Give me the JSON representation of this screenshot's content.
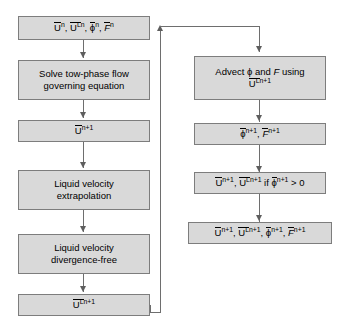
{
  "diagram": {
    "type": "flowchart",
    "colors": {
      "node_fill": "#d9d9d9",
      "node_border": "#7d7d7d",
      "connector": "#6e6e6e",
      "background": "#ffffff",
      "text": "#000000"
    },
    "left_column": {
      "initial_state": {
        "terms": [
          {
            "base": "U",
            "overline": true,
            "sup_left": "",
            "sup": "n"
          },
          {
            "base": "U",
            "overline": true,
            "sup_left": "L",
            "sup": "n"
          },
          {
            "base": "ϕ",
            "overline": true,
            "sup_left": "",
            "sup": "n"
          },
          {
            "base": "F",
            "overline": true,
            "sup_left": "",
            "sup": "n",
            "italic": true
          }
        ],
        "text": "Ūⁿ, Ūᴸⁿ, ϕ̄ⁿ, F̄ⁿ"
      },
      "solve_step": {
        "line1": "Solve tow-phase flow",
        "line2": "governing equation"
      },
      "velocity_state": {
        "terms": [
          {
            "base": "U",
            "overline": true,
            "sup_left": "",
            "sup": "n+1"
          }
        ]
      },
      "extrapolation_step": {
        "line1": "Liquid velocity",
        "line2": "extrapolation"
      },
      "divergence_step": {
        "line1": "Liquid velocity",
        "line2": "divergence-free"
      },
      "liquid_velocity_state": {
        "terms": [
          {
            "base": "U",
            "overline": true,
            "sup_left": "L",
            "sup": "n+1"
          }
        ]
      }
    },
    "right_column": {
      "advect_step": {
        "line1": "Advect ϕ and F using",
        "line1_parts": {
          "pre": "Advect ",
          "phi": "ϕ",
          "mid": " and ",
          "f": "F",
          "post": " using"
        },
        "line2_terms": [
          {
            "base": "U",
            "overline": true,
            "sup_left": "L",
            "sup": "n+1"
          }
        ]
      },
      "advected_state": {
        "terms": [
          {
            "base": "ϕ",
            "overline": true,
            "sup_left": "",
            "sup": "n+1"
          },
          {
            "base": "F",
            "overline": true,
            "sup_left": "",
            "sup": "n+1",
            "italic": true
          }
        ]
      },
      "conditional_state": {
        "terms": [
          {
            "base": "U",
            "overline": true,
            "sup_left": "",
            "sup": "n+1"
          },
          {
            "base": "U",
            "overline": true,
            "sup_left": "L",
            "sup": "n+1"
          }
        ],
        "condition_prefix": "if",
        "condition_term": {
          "base": "ϕ",
          "overline": true,
          "sup": "n+1"
        },
        "condition_operator": "> 0"
      },
      "final_state": {
        "terms": [
          {
            "base": "U",
            "overline": true,
            "sup_left": "",
            "sup": "n+1"
          },
          {
            "base": "U",
            "overline": true,
            "sup_left": "L",
            "sup": "n+1"
          },
          {
            "base": "ϕ",
            "overline": true,
            "sup_left": "",
            "sup": "n+1"
          },
          {
            "base": "F",
            "overline": true,
            "sup_left": "",
            "sup": "n+1",
            "italic": true
          }
        ]
      }
    },
    "separators": {
      "comma": ",",
      "gt_zero": "> 0",
      "if_label": "if"
    }
  }
}
